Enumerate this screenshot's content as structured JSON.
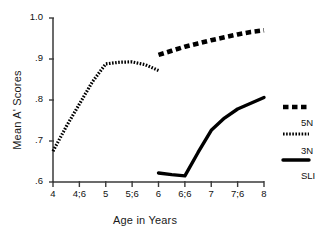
{
  "chart_data": {
    "type": "line",
    "title": "",
    "xlabel": "Age in Years",
    "ylabel": "Mean A' Scores",
    "grid": false,
    "legend_position": "right",
    "xlim": [
      4,
      8
    ],
    "ylim": [
      0.6,
      1.0
    ],
    "xtick_labels": [
      "4",
      "4;6",
      "5",
      "5;6",
      "6",
      "6;6",
      "7",
      "7;6",
      "8"
    ],
    "xtick_values": [
      4,
      4.5,
      5,
      5.5,
      6,
      6.5,
      7,
      7.5,
      8
    ],
    "ytick_labels": [
      "1.0",
      ".9",
      ".8",
      ".7",
      ".6"
    ],
    "ytick_values": [
      1.0,
      0.9,
      0.8,
      0.7,
      0.6
    ],
    "series": [
      {
        "name": "5N",
        "style": "thick-dashed",
        "color": "#000000",
        "x": [
          6,
          6.25,
          6.5,
          6.75,
          7,
          7.25,
          7.5,
          7.75,
          8
        ],
        "values": [
          0.91,
          0.92,
          0.93,
          0.938,
          0.946,
          0.953,
          0.96,
          0.966,
          0.97
        ]
      },
      {
        "name": "3N",
        "style": "fine-dotted",
        "color": "#000000",
        "x": [
          4,
          4.25,
          4.5,
          4.75,
          5,
          5.25,
          5.5,
          5.75,
          6
        ],
        "values": [
          0.675,
          0.735,
          0.79,
          0.845,
          0.888,
          0.892,
          0.893,
          0.886,
          0.872
        ]
      },
      {
        "name": "SLI",
        "style": "thick-solid",
        "color": "#000000",
        "x": [
          6,
          6.25,
          6.5,
          6.75,
          7,
          7.25,
          7.5,
          7.75,
          8
        ],
        "values": [
          0.622,
          0.618,
          0.615,
          0.672,
          0.726,
          0.756,
          0.778,
          0.792,
          0.806
        ]
      }
    ]
  },
  "legend": {
    "entries": [
      {
        "label": "5N",
        "style": "thick-dashed"
      },
      {
        "label": "3N",
        "style": "fine-dotted"
      },
      {
        "label": "SLI",
        "style": "thick-solid"
      }
    ]
  }
}
